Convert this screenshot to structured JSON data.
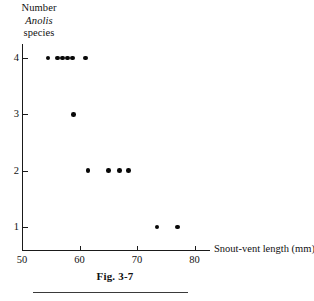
{
  "figure": {
    "caption": "Fig. 3-7",
    "background_color": "#ffffff",
    "ink_color": "#111111"
  },
  "y_axis_title": {
    "line1": "Number",
    "line2": "Anolis",
    "line3": "species"
  },
  "chart_data": {
    "type": "scatter",
    "title": "",
    "subtitle": "",
    "xlabel": "Snout-vent length (mm)",
    "ylabel": "Number Anolis species",
    "xlim": [
      50,
      82.5
    ],
    "ylim": [
      0.35,
      4.4
    ],
    "xticks": [
      50,
      60,
      70,
      80
    ],
    "xtick_labels": [
      "50",
      "60",
      "70",
      "80"
    ],
    "yticks": [
      1,
      2,
      3,
      4
    ],
    "ytick_labels": [
      "1",
      "2",
      "3",
      "4"
    ],
    "grid": false,
    "legend": false,
    "marker": "filled-circle",
    "marker_color": "#080808",
    "points": [
      {
        "x": 54.5,
        "y": 4
      },
      {
        "x": 56.2,
        "y": 4
      },
      {
        "x": 57.0,
        "y": 4
      },
      {
        "x": 57.9,
        "y": 4
      },
      {
        "x": 58.8,
        "y": 4
      },
      {
        "x": 61.0,
        "y": 4
      },
      {
        "x": 59.0,
        "y": 3
      },
      {
        "x": 61.5,
        "y": 2
      },
      {
        "x": 65.0,
        "y": 2
      },
      {
        "x": 67.0,
        "y": 2
      },
      {
        "x": 68.5,
        "y": 2
      },
      {
        "x": 73.5,
        "y": 1
      },
      {
        "x": 77.0,
        "y": 1
      }
    ]
  }
}
